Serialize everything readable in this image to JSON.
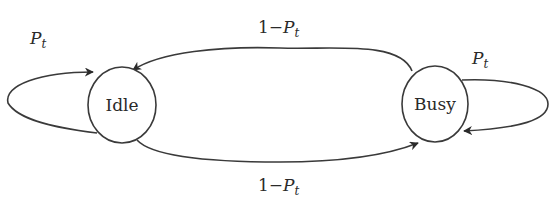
{
  "diagram": {
    "type": "state-transition",
    "states": [
      {
        "id": "idle",
        "label": "Idle"
      },
      {
        "id": "busy",
        "label": "Busy"
      }
    ],
    "transitions": [
      {
        "from": "idle",
        "to": "idle",
        "label_main": "P",
        "label_sub": "t"
      },
      {
        "from": "busy",
        "to": "busy",
        "label_main": "P",
        "label_sub": "t"
      },
      {
        "from": "busy",
        "to": "idle",
        "label_prefix": "1−",
        "label_main": "P",
        "label_sub": "t"
      },
      {
        "from": "idle",
        "to": "busy",
        "label_prefix": "1−",
        "label_main": "P",
        "label_sub": "t"
      }
    ]
  },
  "colors": {
    "stroke": "#3a3a3a",
    "text": "#2a2a2a",
    "background": "#ffffff"
  }
}
